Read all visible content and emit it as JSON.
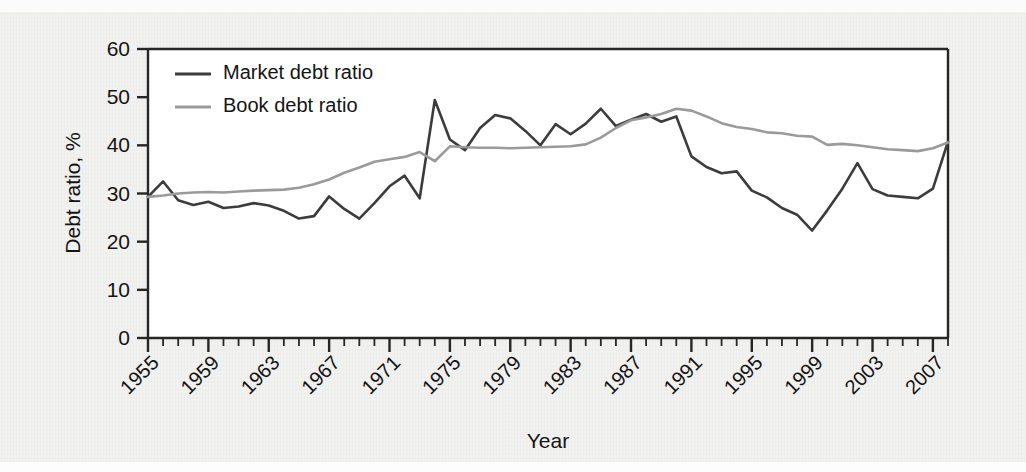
{
  "figure": {
    "background_color": "#ececea",
    "plot_background_color": "#ffffff"
  },
  "chart_data": {
    "type": "line",
    "title": "",
    "xlabel": "Year",
    "ylabel": "Debt ratio, %",
    "xlim": [
      1955,
      2008
    ],
    "ylim": [
      0,
      60
    ],
    "yticks": [
      0,
      10,
      20,
      30,
      40,
      50,
      60
    ],
    "ytick_labels": [
      "0",
      "10",
      "20",
      "30",
      "40",
      "50",
      "60"
    ],
    "xticks_major": [
      1955,
      1959,
      1963,
      1967,
      1971,
      1975,
      1979,
      1983,
      1987,
      1991,
      1995,
      1999,
      2003,
      2007
    ],
    "xtick_labels": [
      "1955",
      "1959",
      "1963",
      "1967",
      "1971",
      "1975",
      "1979",
      "1983",
      "1987",
      "1991",
      "1995",
      "1999",
      "2003",
      "2007"
    ],
    "xtick_minor_interval": 1,
    "xtick_label_rotation": 45,
    "grid": false,
    "legend_position": "top-left-inside",
    "x": [
      1955,
      1956,
      1957,
      1958,
      1959,
      1960,
      1961,
      1962,
      1963,
      1964,
      1965,
      1966,
      1967,
      1968,
      1969,
      1970,
      1971,
      1972,
      1973,
      1974,
      1975,
      1976,
      1977,
      1978,
      1979,
      1980,
      1981,
      1982,
      1983,
      1984,
      1985,
      1986,
      1987,
      1988,
      1989,
      1990,
      1991,
      1992,
      1993,
      1994,
      1995,
      1996,
      1997,
      1998,
      1999,
      2000,
      2001,
      2002,
      2003,
      2004,
      2005,
      2006,
      2007,
      2008
    ],
    "series": [
      {
        "name": "Market debt ratio",
        "color": "#3c3c3c",
        "line_width": 2.6,
        "values": [
          29.3,
          32.5,
          28.6,
          27.6,
          28.3,
          27.0,
          27.3,
          28.0,
          27.5,
          26.4,
          24.8,
          25.3,
          29.4,
          26.8,
          24.8,
          28.0,
          31.5,
          33.7,
          29.0,
          49.4,
          41.2,
          39.0,
          43.6,
          46.3,
          45.6,
          43.0,
          40.0,
          44.4,
          42.3,
          44.5,
          47.6,
          44.0,
          45.3,
          46.5,
          44.9,
          46.0,
          37.7,
          35.5,
          34.2,
          34.6,
          30.6,
          29.2,
          27.0,
          25.6,
          22.3,
          26.5,
          31.0,
          36.3,
          30.9,
          29.6,
          29.3,
          29.0,
          31.0,
          40.8
        ]
      },
      {
        "name": "Book debt ratio",
        "color": "#9a9a9a",
        "line_width": 2.6,
        "values": [
          29.3,
          29.6,
          30.0,
          30.2,
          30.3,
          30.2,
          30.4,
          30.6,
          30.7,
          30.8,
          31.2,
          31.9,
          32.9,
          34.3,
          35.4,
          36.6,
          37.1,
          37.6,
          38.6,
          36.7,
          39.8,
          39.6,
          39.5,
          39.5,
          39.4,
          39.5,
          39.6,
          39.7,
          39.8,
          40.2,
          41.6,
          43.6,
          45.2,
          45.8,
          46.5,
          47.6,
          47.2,
          46.0,
          44.6,
          43.8,
          43.4,
          42.7,
          42.5,
          42.0,
          41.8,
          40.1,
          40.3,
          40.0,
          39.6,
          39.2,
          39.0,
          38.8,
          39.4,
          40.6
        ]
      }
    ]
  },
  "legend": {
    "items": [
      {
        "label": "Market debt ratio",
        "color": "#3c3c3c"
      },
      {
        "label": "Book debt ratio",
        "color": "#9a9a9a"
      }
    ]
  }
}
